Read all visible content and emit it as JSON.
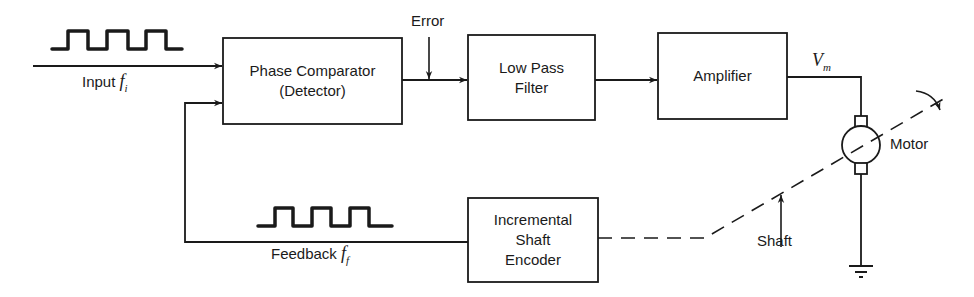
{
  "diagram": {
    "type": "block-diagram",
    "colors": {
      "line": "#1a1a1a",
      "background": "#ffffff"
    }
  },
  "blocks": {
    "phase_comparator": {
      "line1": "Phase Comparator",
      "line2": "(Detector)"
    },
    "low_pass_filter": {
      "line1": "Low Pass",
      "line2": "Filter"
    },
    "amplifier": {
      "line1": "Amplifier"
    },
    "encoder": {
      "line1": "Incremental",
      "line2": "Shaft",
      "line3": "Encoder"
    }
  },
  "labels": {
    "input": {
      "text": "Input ",
      "symbol": "f",
      "subscript": "i"
    },
    "feedback": {
      "text": "Feedback ",
      "symbol": "f",
      "subscript": "f"
    },
    "error": "Error",
    "vm": {
      "symbol": "V",
      "subscript": "m"
    },
    "motor": "Motor",
    "shaft": "Shaft"
  },
  "icons": {
    "input_waveform": "square-wave-icon",
    "feedback_waveform": "square-wave-icon",
    "motor": "dc-motor-icon",
    "ground": "ground-icon",
    "rotation": "rotation-arrow-icon"
  }
}
